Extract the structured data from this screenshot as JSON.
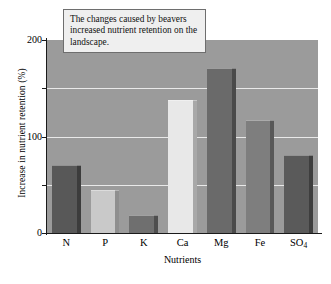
{
  "chart_data": {
    "type": "bar",
    "title": "",
    "categories": [
      "N",
      "P",
      "K",
      "Ca",
      "Mg",
      "Fe",
      "SO4"
    ],
    "category_labels_html": [
      "N",
      "P",
      "K",
      "Ca",
      "Mg",
      "Fe",
      "SO<sub>4</sub>"
    ],
    "values": [
      70,
      45,
      19,
      138,
      171,
      117,
      81
    ],
    "xlabel": "Nutrients",
    "ylabel": "Increase in nutrient retention (%)",
    "ylim": [
      0,
      200
    ],
    "yticks": [
      0,
      100,
      200
    ],
    "ytick_labels": [
      "0",
      "100",
      "200"
    ],
    "yminor_ticks": [
      50,
      150
    ],
    "gridlines": [
      50,
      100,
      150
    ],
    "grid": true,
    "legend": "none",
    "plot_background": "#9b9b9b",
    "gridline_color": "#e9e9e9",
    "bar_colors": [
      "#585858",
      "#c9c9c9",
      "#6f6f6f",
      "#e8e8e8",
      "#6a6a6a",
      "#7e7e7e",
      "#5a5a5a"
    ],
    "bar_side_colors": [
      "#3c3c3c",
      "#8f8f8f",
      "#4e4e4e",
      "#a8a8a8",
      "#4a4a4a",
      "#585858",
      "#3e3e3e"
    ],
    "annotation": "The changes caused by beavers increased nutrient retention on the landscape."
  },
  "axes": {
    "ylabel": "Increase in nutrient retention (%)",
    "xlabel": "Nutrients"
  },
  "annotation": {
    "text": "The changes caused by beavers increased nutrient retention on the landscape."
  }
}
